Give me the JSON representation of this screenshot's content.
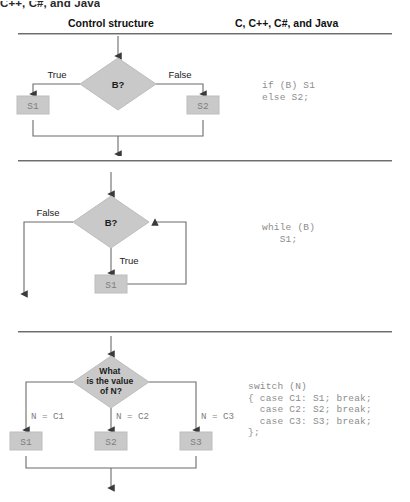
{
  "caption_fragment": "C++, C#, and Java",
  "headers": {
    "left": "Control structure",
    "right": "C, C++, C#, and Java"
  },
  "colors": {
    "shape_fill": "#c9c9c9",
    "shape_stroke": "#b0b0b0",
    "line": "#6b6b6b",
    "rule": "#6d6d6d",
    "code_text": "#8d8d8d",
    "label_text": "#1b1b1b"
  },
  "sections": [
    {
      "id": "if-else",
      "decision": "B?",
      "labels": {
        "true": "True",
        "false": "False"
      },
      "boxes": [
        "S1",
        "S2"
      ],
      "code": "if (B) S1\nelse S2;"
    },
    {
      "id": "while-loop",
      "decision": "B?",
      "labels": {
        "true": "True",
        "false": "False"
      },
      "boxes": [
        "S1"
      ],
      "code": "while (B)\n   S1;"
    },
    {
      "id": "switch",
      "decision_lines": [
        "What",
        "is the value",
        "of N?"
      ],
      "labels": {
        "case1": "N = C1",
        "case2": "N = C2",
        "case3": "N = C3"
      },
      "boxes": [
        "S1",
        "S2",
        "S3"
      ],
      "code": "switch (N)\n{ case C1: S1; break;\n  case C2: S2; break;\n  case C3: S3; break;\n};"
    }
  ]
}
